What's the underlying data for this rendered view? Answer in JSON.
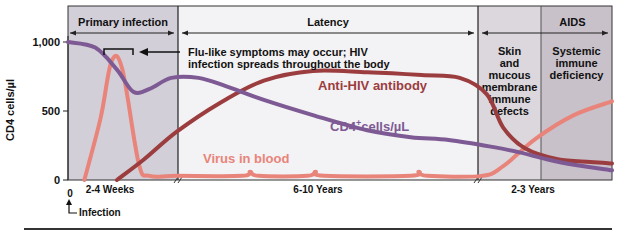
{
  "chart_data": {
    "type": "line",
    "title": "",
    "ylabel": "CD4 cells/µl",
    "xlabel": "",
    "ylim": [
      0,
      1000
    ],
    "yticks": [
      {
        "value": 0,
        "label": "0"
      },
      {
        "value": 500,
        "label": "500"
      },
      {
        "value": 1000,
        "label": "1,000"
      }
    ],
    "x_origin_label": "0",
    "infection_label": "Infection",
    "phases": [
      {
        "name": "Primary infection",
        "duration_label": "2-4 Weeks",
        "color": "#d3cfd9"
      },
      {
        "name": "Latency",
        "duration_label": "6-10 Years",
        "color": "#f3f2f4"
      },
      {
        "name": "AIDS",
        "duration_label": "2-3 Years",
        "subphases": [
          {
            "name": "Skin and mucous membrane immune defects",
            "lines": [
              "Skin",
              "and",
              "mucous",
              "membrane",
              "immune",
              "defects"
            ],
            "color": "#dcd7dd"
          },
          {
            "name": "Systemic immune deficiency",
            "lines": [
              "Systemic",
              "immune",
              "deficiency"
            ],
            "color": "#c9c1ca"
          }
        ]
      }
    ],
    "annotation": {
      "lines": [
        "Flu-like symptoms may occur; HIV",
        "infection spreads throughout the body"
      ]
    },
    "x_note": "x axis is schematic time (weeks → years → years); values given as fraction of plot width",
    "series": [
      {
        "name": "CD4⁺cells/µL",
        "label_main": "CD4",
        "label_sup": "+",
        "label_rest": "cells/µL",
        "color": "#7e5a95",
        "points": [
          [
            0.0,
            1000
          ],
          [
            0.05,
            960
          ],
          [
            0.09,
            800
          ],
          [
            0.12,
            640
          ],
          [
            0.15,
            660
          ],
          [
            0.19,
            740
          ],
          [
            0.24,
            740
          ],
          [
            0.29,
            680
          ],
          [
            0.36,
            580
          ],
          [
            0.45,
            470
          ],
          [
            0.55,
            360
          ],
          [
            0.63,
            310
          ],
          [
            0.7,
            290
          ],
          [
            0.78,
            240
          ],
          [
            0.83,
            200
          ],
          [
            0.88,
            150
          ],
          [
            0.93,
            110
          ],
          [
            1.0,
            70
          ]
        ]
      },
      {
        "name": "Anti-HIV antibody",
        "color": "#9b3d3f",
        "points": [
          [
            0.09,
            0
          ],
          [
            0.14,
            150
          ],
          [
            0.2,
            350
          ],
          [
            0.28,
            560
          ],
          [
            0.36,
            720
          ],
          [
            0.45,
            790
          ],
          [
            0.55,
            780
          ],
          [
            0.65,
            760
          ],
          [
            0.72,
            740
          ],
          [
            0.77,
            620
          ],
          [
            0.8,
            380
          ],
          [
            0.84,
            230
          ],
          [
            0.9,
            150
          ],
          [
            0.96,
            130
          ],
          [
            1.0,
            120
          ]
        ]
      },
      {
        "name": "Virus in blood",
        "color": "#e8847a",
        "points": [
          [
            0.03,
            0
          ],
          [
            0.06,
            450
          ],
          [
            0.08,
            860
          ],
          [
            0.1,
            800
          ],
          [
            0.13,
            120
          ],
          [
            0.15,
            30
          ],
          [
            0.2,
            30
          ],
          [
            0.32,
            30
          ],
          [
            0.335,
            60
          ],
          [
            0.35,
            30
          ],
          [
            0.44,
            30
          ],
          [
            0.455,
            60
          ],
          [
            0.47,
            30
          ],
          [
            0.63,
            30
          ],
          [
            0.645,
            60
          ],
          [
            0.66,
            30
          ],
          [
            0.76,
            30
          ],
          [
            0.8,
            100
          ],
          [
            0.86,
            300
          ],
          [
            0.93,
            470
          ],
          [
            1.0,
            570
          ]
        ]
      }
    ]
  }
}
